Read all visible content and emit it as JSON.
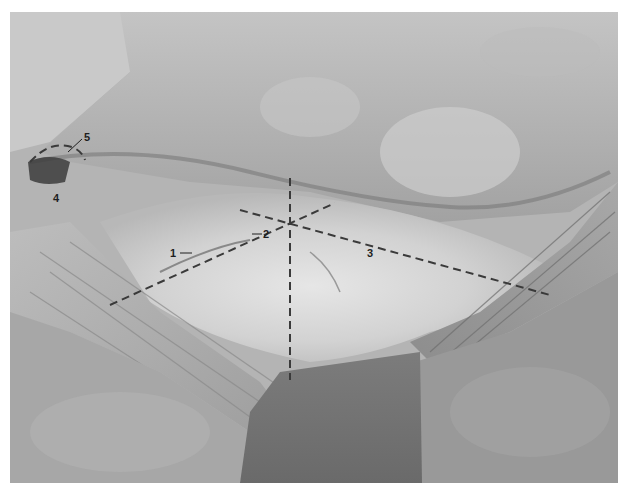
{
  "figure": {
    "colors": {
      "background": "#ffffff",
      "annotation": "#3a3a3a",
      "label_text": "#1e1e1e"
    },
    "labels": [
      {
        "id": "1",
        "text": "1"
      },
      {
        "id": "2",
        "text": "2"
      },
      {
        "id": "3",
        "text": "3"
      },
      {
        "id": "4",
        "text": "4"
      },
      {
        "id": "5",
        "text": "5"
      }
    ]
  }
}
